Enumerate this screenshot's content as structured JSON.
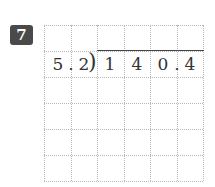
{
  "problem": {
    "number": "7",
    "divisor": [
      "5",
      ".",
      "2"
    ],
    "dividend": [
      "1",
      "4",
      "0",
      ".",
      "4"
    ],
    "grid": {
      "columns": 6,
      "rows": 6
    }
  }
}
